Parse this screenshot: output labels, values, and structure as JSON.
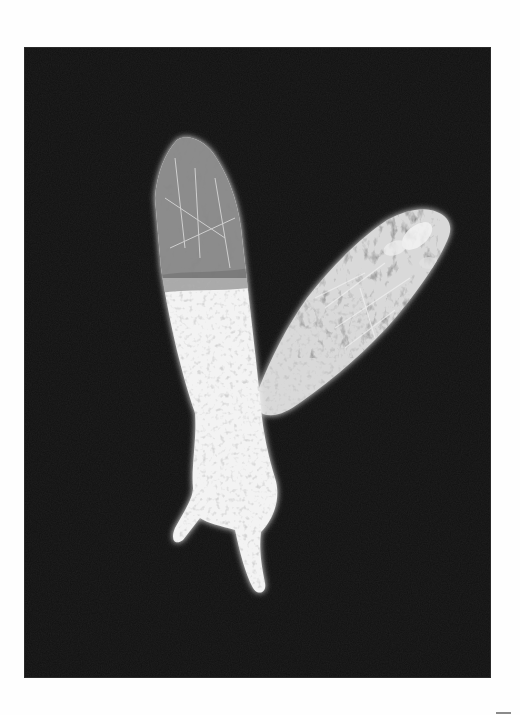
{
  "artwork": {
    "type": "photogram",
    "description": "Two white hand silhouettes filled with plant textures on a black rectangle",
    "colors": {
      "paper": "#fefefe",
      "print_background": "#111111",
      "silhouette_light": "#f4f4f4",
      "silhouette_mid": "#bdbdbd",
      "plant_texture_dark": "#5a5a5a"
    },
    "print_frame": {
      "x": 25,
      "y": 48,
      "width": 465,
      "height": 629
    },
    "subjects": [
      {
        "name": "left-hand",
        "orientation": "vertical, fingers up, two fingers pointing down-left at wrist end"
      },
      {
        "name": "right-hand",
        "orientation": "diagonal, pointing up-right"
      }
    ],
    "corner_mark": {
      "x": 496,
      "y": 712,
      "width": 15,
      "height": 2
    }
  }
}
